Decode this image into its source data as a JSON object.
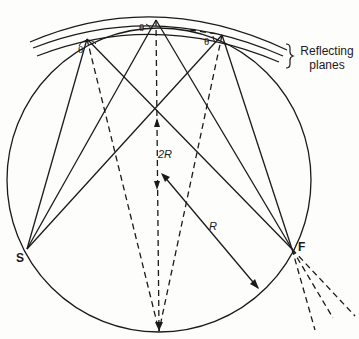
{
  "diagram": {
    "labels": {
      "theta_left": "θ",
      "theta_top": "θ",
      "theta_right": "θ",
      "source": "S",
      "focus": "F",
      "two_r": "2R",
      "radius": "R",
      "planes_line1": "Reflecting",
      "planes_line2": "planes"
    },
    "colors": {
      "ink": "#1a1a1a",
      "background": "#fdfdfc"
    }
  }
}
